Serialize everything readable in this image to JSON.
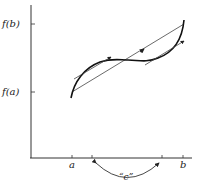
{
  "diagram": {
    "y_axis": {
      "ticks": [
        {
          "label": "f(b)",
          "y": 24
        },
        {
          "label": "f(a)",
          "y": 92
        }
      ]
    },
    "x_axis": {
      "ticks": [
        {
          "label": "a",
          "x": 72
        },
        {
          "label": "",
          "x": 92
        },
        {
          "label": "",
          "x": 162
        },
        {
          "label": "b",
          "x": 183
        }
      ]
    },
    "c_label": "“c”",
    "elements": {
      "curve": "f(x) cubic-like curve from (a, f(a)) to (b, f(b))",
      "secant": "line from (a, f(a)) to (b, f(b))",
      "tangents": [
        "tangent at first c",
        "tangent at second c"
      ]
    },
    "colors": {
      "ink": "#222222",
      "background": "#ffffff"
    }
  }
}
